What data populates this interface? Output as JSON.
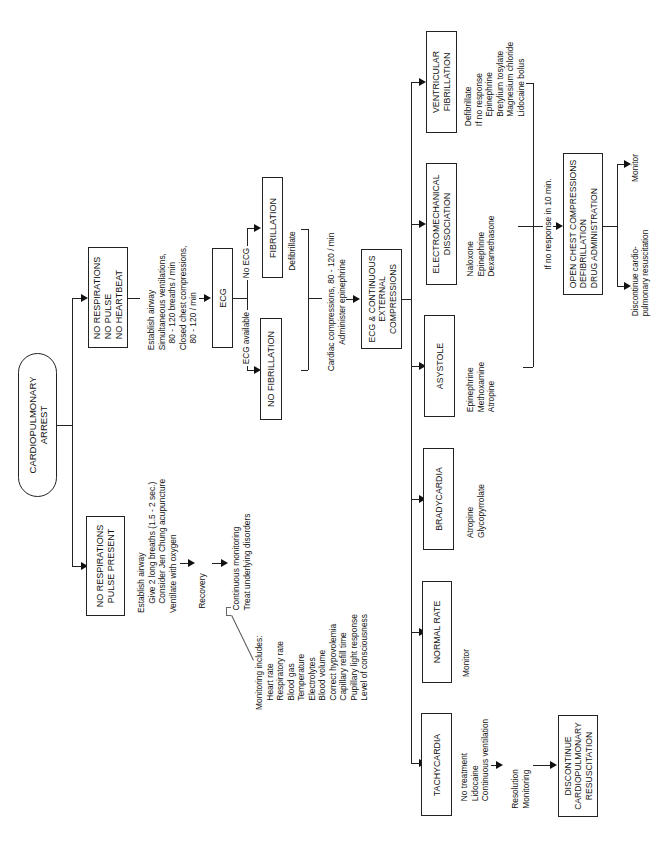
{
  "diagram": {
    "title": "CARDIOPULMONARY ARREST",
    "root": {
      "label": "CARDIOPULMONARY\nARREST"
    },
    "branch_pulse_present": {
      "box": "NO RESPIRATIONS\nPULSE PRESENT",
      "actions": "Establish airway\n    Give 2 long breaths (1.5 - 2 sec.)\n    Consider Jen Chung acupuncture\nVentilate with oxygen",
      "recovery": "Recovery",
      "followup": "Continuous monitoring\nTreat underlying disorders",
      "monitoring": "Monitoring includes:\n    Heart rate\n    Respiratory rate\n    Blood gas\n    Temperature\n    Electrolytes\n    Blood volume\n    Correct hypovolemia\n    Capillary refill time\n    Pupillary light response\n    Level of consciousness"
    },
    "branch_no_heartbeat": {
      "box": "NO RESPIRATIONS\nNO PULSE\nNO HEARTBEAT",
      "actions": "Establish airway\nSimultaneous ventilations,\n   80 - 120 breaths / min\nClosed chest compressions,\n   80 - 120 / min",
      "ecg_box": "ECG",
      "ecg_available_label": "ECG available",
      "no_ecg_label": "No ECG",
      "fibrillation_box": "FIBRILLATION",
      "no_fibrillation_box": "NO FIBRILLATION",
      "defibrillate": "Defibrillate",
      "cardiac": "Cardiac compressions, 80 - 120 / min\nAdminister epinephrine",
      "ecg_continuous_box": "ECG & CONTINUOUS\nEXTERNAL\nCOMPRESSIONS"
    },
    "rhythms": [
      {
        "box": "VENTRICULAR\nFIBRILLATION",
        "treatment": "Defibrillate\nIf no response\n    Epinephrine\n    Bretylium tosylate\n    Magnesium chloride\n    Lidocaine bolus"
      },
      {
        "box": "ELECTROMECHANICAL\nDISSOCIATION",
        "treatment": "Naloxone\nEpinephrine\nDexamethasone"
      },
      {
        "box": "ASYSTOLE",
        "treatment": "Epinephrine\nMethoxamine\nAtropine"
      },
      {
        "box": "BRADYCARDIA",
        "treatment": "Atropine\nGlycopyrrolate"
      },
      {
        "box": "NORMAL RATE",
        "treatment": "Monitor"
      },
      {
        "box": "TACHYCARDIA",
        "treatment": "No treatment\nLidocaine\nContinuous ventilation"
      }
    ],
    "tachy_followup": {
      "resolution": "Resolution\nMonitoring",
      "discontinue_box": "DISCONTINUE\nCARDIOPULMONARY\nRESUSCITATION"
    },
    "no_response": {
      "label": "If no response in 10 min.",
      "box": "OPEN CHEST COMPRESSIONS\nDEFIBRILLATION\nDRUG ADMINISTRATION",
      "monitor": "Monitor",
      "discontinue": "Discontinue cardio-\npulmonary resuscitation"
    }
  }
}
